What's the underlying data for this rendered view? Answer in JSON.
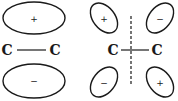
{
  "diagram": {
    "title": "",
    "bonding_pi": {
      "atom_left": "C",
      "atom_right": "C",
      "upper_lobe_sign": "+",
      "lower_lobe_sign": "−"
    },
    "antibonding_pi_star": {
      "atom_left": "C",
      "atom_right": "C",
      "upper_left_sign": "+",
      "upper_right_sign": "−",
      "lower_left_sign": "−",
      "lower_right_sign": "+",
      "nodal_plane": "dashed vertical line"
    },
    "colors": {
      "stroke": "#1a1a1a",
      "background": "#ffffff"
    }
  }
}
